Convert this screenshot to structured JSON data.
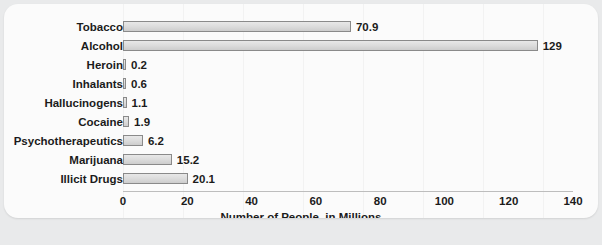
{
  "chart_data": {
    "type": "bar",
    "orientation": "horizontal",
    "title": "",
    "xlabel": "Number of People, in Millions",
    "ylabel": "",
    "xlim": [
      0,
      140
    ],
    "xticks": [
      0,
      20,
      40,
      60,
      80,
      100,
      120,
      140
    ],
    "xtick_labels": [
      "0",
      "20",
      "40",
      "60",
      "80",
      "100",
      "120",
      "140"
    ],
    "grid": false,
    "legend": null,
    "categories": [
      "Tobacco",
      "Alcohol",
      "Heroin",
      "Inhalants",
      "Hallucinogens",
      "Cocaine",
      "Psychotherapeutics",
      "Marijuana",
      "Illicit Drugs"
    ],
    "values": [
      70.9,
      129,
      0.2,
      0.6,
      1.1,
      1.9,
      6.2,
      15.2,
      20.1
    ],
    "value_labels": [
      "70.9",
      "129",
      "0.2",
      "0.6",
      "1.1",
      "1.9",
      "6.2",
      "15.2",
      "20.1"
    ],
    "bar_fill_color": "#dcdcdc",
    "bar_border_color": "#8a8a8a",
    "panel_background": "#fbfbfb",
    "page_background": "#e9eaeb",
    "text_color": "#1b1b1b"
  }
}
